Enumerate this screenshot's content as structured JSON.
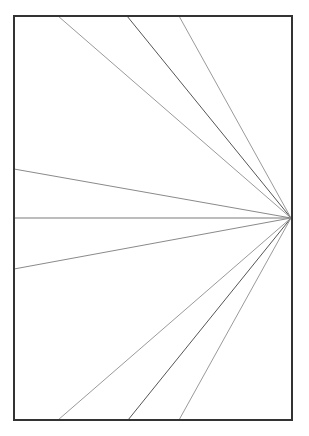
{
  "diagram": {
    "type": "radiating-lines",
    "canvas": {
      "width": 309,
      "height": 436,
      "background": "#ffffff"
    },
    "frame": {
      "x": 14,
      "y": 16,
      "width": 278,
      "height": 404,
      "stroke": "#333333",
      "stroke_width": 2
    },
    "focal_point": {
      "x": 291,
      "y": 218
    },
    "rays": [
      {
        "id": "top-1",
        "end": {
          "x": 58,
          "y": 16
        },
        "stroke": "#9a9a9a"
      },
      {
        "id": "top-2",
        "end": {
          "x": 127,
          "y": 16
        },
        "stroke": "#555555"
      },
      {
        "id": "top-3",
        "end": {
          "x": 179,
          "y": 16
        },
        "stroke": "#9a9a9a"
      },
      {
        "id": "left-1",
        "end": {
          "x": 14,
          "y": 169
        },
        "stroke": "#8a8a8a"
      },
      {
        "id": "left-2",
        "end": {
          "x": 14,
          "y": 218
        },
        "stroke": "#7a7a7a"
      },
      {
        "id": "left-3",
        "end": {
          "x": 14,
          "y": 269
        },
        "stroke": "#8a8a8a"
      },
      {
        "id": "bottom-1",
        "end": {
          "x": 58,
          "y": 420
        },
        "stroke": "#9a9a9a"
      },
      {
        "id": "bottom-2",
        "end": {
          "x": 128,
          "y": 420
        },
        "stroke": "#555555"
      },
      {
        "id": "bottom-3",
        "end": {
          "x": 179,
          "y": 420
        },
        "stroke": "#9a9a9a"
      }
    ],
    "ray_width": 1
  }
}
